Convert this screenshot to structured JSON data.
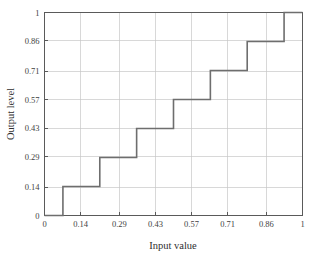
{
  "figure": {
    "background_color": "#ffffff",
    "axes_color": "#5a5a5a",
    "grid_color": "#c8c8c8",
    "line_color": "#6e6e6e"
  },
  "chart_data": {
    "type": "line",
    "title": "",
    "subtitle": "",
    "xlabel": "Input value",
    "ylabel": "Output level",
    "xlim": [
      0,
      1
    ],
    "ylim": [
      0,
      1
    ],
    "grid": true,
    "legend": null,
    "legend_position": "none",
    "drawstyle": "steps-post",
    "xticks": [
      0,
      0.14,
      0.29,
      0.43,
      0.57,
      0.71,
      0.86,
      1
    ],
    "xticklabels": [
      "0",
      "0.14",
      "0.29",
      "0.43",
      "0.57",
      "0.71",
      "0.86",
      "1"
    ],
    "yticks": [
      0,
      0.14,
      0.29,
      0.43,
      0.57,
      0.71,
      0.86,
      1
    ],
    "yticklabels": [
      "0",
      "0.14",
      "0.29",
      "0.43",
      "0.57",
      "0.71",
      "0.86",
      "1"
    ],
    "series": [
      {
        "name": "quantizer-transfer",
        "x": [
          0,
          0.0714,
          0.0714,
          0.2143,
          0.2143,
          0.3571,
          0.3571,
          0.5,
          0.5,
          0.6429,
          0.6429,
          0.7857,
          0.7857,
          0.9286,
          0.9286,
          1
        ],
        "values": [
          0,
          0,
          0.1429,
          0.1429,
          0.2857,
          0.2857,
          0.4286,
          0.4286,
          0.5714,
          0.5714,
          0.7143,
          0.7143,
          0.8571,
          0.8571,
          1,
          1
        ]
      }
    ],
    "steps": [
      {
        "output_level": 0,
        "input_start": 0,
        "input_end": 0.0714
      },
      {
        "output_level": 0.1429,
        "input_start": 0.0714,
        "input_end": 0.2143
      },
      {
        "output_level": 0.2857,
        "input_start": 0.2143,
        "input_end": 0.3571
      },
      {
        "output_level": 0.4286,
        "input_start": 0.3571,
        "input_end": 0.5
      },
      {
        "output_level": 0.5714,
        "input_start": 0.5,
        "input_end": 0.6429
      },
      {
        "output_level": 0.7143,
        "input_start": 0.6429,
        "input_end": 0.7857
      },
      {
        "output_level": 0.8571,
        "input_start": 0.7857,
        "input_end": 0.9286
      },
      {
        "output_level": 1,
        "input_start": 0.9286,
        "input_end": 1
      }
    ]
  }
}
